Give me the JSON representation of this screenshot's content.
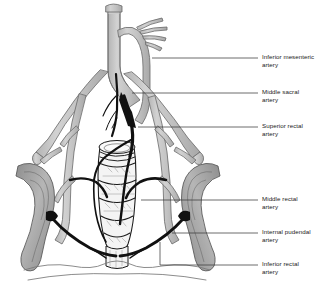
{
  "figure": {
    "type": "anatomical-illustration",
    "view": "anterior / coronal section of pelvis"
  },
  "colors": {
    "vessel_light": "#c6c6c6",
    "vessel_outline": "#6e6e6e",
    "vessel_dark": "#1a1a1a",
    "bone_fill": "#9a9a9a",
    "bone_outline": "#5a5a5a",
    "rectum_fill": "#f2f2f2",
    "rectum_outline": "#1a1a1a",
    "leader_line": "#3c3c3c",
    "text": "#1a1a1a",
    "background": "#ffffff"
  },
  "labels": [
    {
      "id": "inferior-mesenteric-artery",
      "line1": "Inferior mesenteric",
      "line2": "artery",
      "text_x": 262,
      "text_y": 55,
      "leader": {
        "x1": 152,
        "y1": 58,
        "x2": 258,
        "y2": 58
      }
    },
    {
      "id": "middle-sacral-artery",
      "line1": "Middle sacral",
      "line2": "artery",
      "text_x": 262,
      "text_y": 90,
      "leader": {
        "x1": 132,
        "y1": 93,
        "x2": 258,
        "y2": 93
      }
    },
    {
      "id": "superior-rectal-artery",
      "line1": "Superior rectal",
      "line2": "artery",
      "text_x": 262,
      "text_y": 124,
      "leader": {
        "x1": 138,
        "y1": 127,
        "x2": 258,
        "y2": 127
      }
    },
    {
      "id": "middle-rectal-artery",
      "line1": "Middle rectal",
      "line2": "artery",
      "text_x": 262,
      "text_y": 197,
      "leader": {
        "x1": 141,
        "y1": 200,
        "x2": 258,
        "y2": 200
      }
    },
    {
      "id": "internal-pudendal-artery",
      "line1": "Internal pudendal",
      "line2": "artery",
      "text_x": 262,
      "text_y": 230,
      "leader": {
        "x1": 172,
        "y1": 233,
        "x2": 258,
        "y2": 233
      }
    },
    {
      "id": "inferior-rectal-artery",
      "line1": "Inferior rectal",
      "line2": "artery",
      "text_x": 262,
      "text_y": 262,
      "leader": {
        "x1": 160,
        "y1": 265,
        "x2": 258,
        "y2": 265
      },
      "elbow": {
        "x": 160,
        "y_top": 242,
        "y_bottom": 265
      }
    }
  ],
  "structures": [
    {
      "id": "abdominal-aorta",
      "kind": "vessel",
      "tone": "light"
    },
    {
      "id": "common-iliac-artery-left",
      "kind": "vessel",
      "tone": "light"
    },
    {
      "id": "common-iliac-artery-right",
      "kind": "vessel",
      "tone": "light"
    },
    {
      "id": "internal-iliac-artery-left",
      "kind": "vessel",
      "tone": "light"
    },
    {
      "id": "internal-iliac-artery-right",
      "kind": "vessel",
      "tone": "light"
    },
    {
      "id": "sigmoid-branches",
      "kind": "vessel",
      "tone": "light"
    },
    {
      "id": "inferior-mesenteric-artery",
      "kind": "vessel",
      "tone": "light"
    },
    {
      "id": "middle-sacral-artery",
      "kind": "vessel",
      "tone": "dark"
    },
    {
      "id": "superior-rectal-artery",
      "kind": "vessel",
      "tone": "dark"
    },
    {
      "id": "middle-rectal-artery",
      "kind": "vessel",
      "tone": "dark"
    },
    {
      "id": "inferior-rectal-artery",
      "kind": "vessel",
      "tone": "dark"
    },
    {
      "id": "internal-pudendal-artery",
      "kind": "vessel",
      "tone": "light"
    },
    {
      "id": "rectum",
      "kind": "organ"
    },
    {
      "id": "anal-canal",
      "kind": "organ"
    },
    {
      "id": "ischium-left",
      "kind": "bone"
    },
    {
      "id": "ischium-right",
      "kind": "bone"
    },
    {
      "id": "perineum-outline",
      "kind": "soft-tissue"
    }
  ]
}
